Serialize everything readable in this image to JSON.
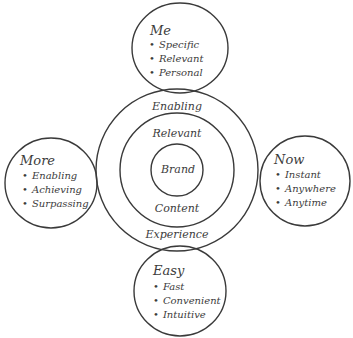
{
  "diagram": {
    "core": {
      "center": "Brand",
      "middle_top": "Relevant",
      "middle_bottom": "Content",
      "outer_top": "Enabling",
      "outer_bottom": "Experience"
    },
    "satellites": {
      "top": {
        "title": "Me",
        "items": [
          "Specific",
          "Relevant",
          "Personal"
        ]
      },
      "left": {
        "title": "More",
        "items": [
          "Enabling",
          "Achieving",
          "Surpassing"
        ]
      },
      "right": {
        "title": "Now",
        "items": [
          "Instant",
          "Anywhere",
          "Anytime"
        ]
      },
      "bottom": {
        "title": "Easy",
        "items": [
          "Fast",
          "Convenient",
          "Intuitive"
        ]
      }
    },
    "stroke_color": "#3a3a3a"
  }
}
